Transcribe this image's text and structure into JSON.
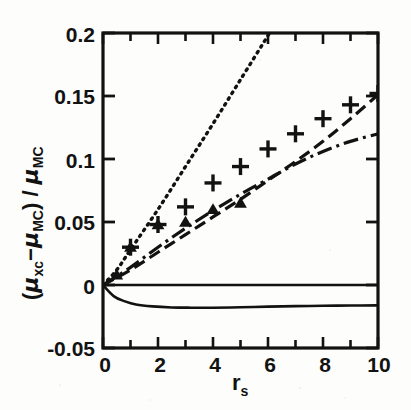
{
  "figure": {
    "kind": "scientific-plot",
    "background_color": "#fdfdfb",
    "ink_color": "#121212",
    "x_axis": {
      "label_parts": {
        "base": "r",
        "sub": "s"
      },
      "label_text": "rs",
      "ticks": [
        0,
        2,
        4,
        6,
        8,
        10
      ],
      "tick_labels": [
        "0",
        "2",
        "4",
        "6",
        "8",
        "10"
      ],
      "minor_tick_step": 1,
      "range": [
        0,
        10
      ]
    },
    "y_axis": {
      "label_parts": {
        "open": "(",
        "mu1": "μ",
        "sub1": "xc",
        "minus": "−",
        "mu2": "μ",
        "sub2": "MC",
        "close": ")",
        "slash": " / ",
        "mu3": "μ",
        "sub3": "MC"
      },
      "label_text": "(μxc − μMC) / μMC",
      "ticks": [
        -0.05,
        0,
        0.05,
        0.1,
        0.15,
        0.2
      ],
      "tick_labels": [
        "-0.05",
        "0",
        "0.05",
        "0.1",
        "0.15",
        "0.2"
      ],
      "range": [
        -0.05,
        0.2
      ]
    }
  },
  "chart_data": {
    "type": "scatter",
    "title": "",
    "xlabel": "rs",
    "ylabel": "(μxc − μMC) / μMC",
    "xlim": [
      0,
      10
    ],
    "ylim": [
      -0.05,
      0.2
    ],
    "grid": false,
    "legend": "none",
    "series": [
      {
        "name": "plus-markers",
        "style": "marker",
        "marker": "+",
        "x": [
          1,
          2,
          3,
          4,
          5,
          6,
          7,
          8,
          9,
          10
        ],
        "y": [
          0.03,
          0.048,
          0.062,
          0.081,
          0.094,
          0.108,
          0.12,
          0.132,
          0.143,
          0.152
        ]
      },
      {
        "name": "triangle-markers",
        "style": "marker",
        "marker": "triangle",
        "x": [
          0.5,
          1,
          2,
          3,
          4,
          5
        ],
        "y": [
          0.008,
          0.03,
          0.048,
          0.05,
          0.06,
          0.065
        ]
      },
      {
        "name": "dotted-curve",
        "style": "dotted",
        "x": [
          0,
          0.5,
          1,
          2,
          3,
          4,
          5,
          6,
          6.05
        ],
        "y": [
          0.0,
          0.012,
          0.028,
          0.06,
          0.094,
          0.128,
          0.163,
          0.198,
          0.2
        ]
      },
      {
        "name": "dashed-curve",
        "style": "dashed",
        "x": [
          0,
          1,
          2,
          3,
          4,
          5,
          6,
          7,
          8,
          9,
          10
        ],
        "y": [
          0.0,
          0.012,
          0.026,
          0.04,
          0.054,
          0.068,
          0.083,
          0.098,
          0.114,
          0.132,
          0.151
        ]
      },
      {
        "name": "dash-dot-curve",
        "style": "dash-dot",
        "x": [
          0,
          1,
          2,
          3,
          4,
          5,
          6,
          7,
          8,
          9,
          10
        ],
        "y": [
          0.0,
          0.014,
          0.03,
          0.045,
          0.059,
          0.072,
          0.084,
          0.096,
          0.106,
          0.114,
          0.12
        ]
      },
      {
        "name": "zero-line",
        "style": "solid",
        "x": [
          0,
          10
        ],
        "y": [
          0.0,
          0.0
        ]
      },
      {
        "name": "solid-negative-curve",
        "style": "solid",
        "x": [
          0,
          0.4,
          0.8,
          1.2,
          1.8,
          2.5,
          3.2,
          4,
          5,
          6,
          7,
          8,
          9,
          10
        ],
        "y": [
          0.0,
          -0.009,
          -0.013,
          -0.0155,
          -0.017,
          -0.0178,
          -0.018,
          -0.018,
          -0.0177,
          -0.0172,
          -0.0168,
          -0.0165,
          -0.0163,
          -0.0162
        ]
      }
    ]
  }
}
